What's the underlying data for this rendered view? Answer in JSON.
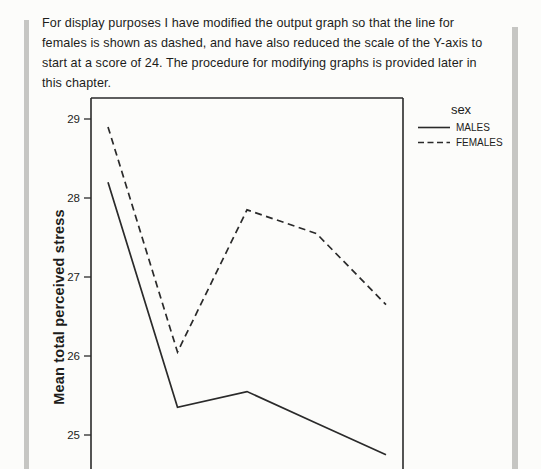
{
  "page": {
    "paragraph_lines": [
      "For display purposes I have modified the output graph so that the line for",
      "females is shown as dashed, and have also reduced the scale of the Y-axis to",
      "start at a score of 24. The procedure for modifying graphs is provided later in",
      "this chapter."
    ]
  },
  "colors": {
    "ink": "#1d1d1b",
    "chart_line": "#2a2a2a",
    "page_rule": "#c6c6c3",
    "background": "#fcfcfa"
  },
  "chart_data": {
    "type": "line",
    "title": "",
    "xlabel": "",
    "ylabel": "Mean total perceived stress",
    "x": [
      1,
      2,
      3,
      4,
      5
    ],
    "x_axis_labels_visible": false,
    "y_ticks": [
      29,
      28,
      27,
      26,
      25
    ],
    "y_axis_starts_at": 24,
    "ylim_visible": [
      24.55,
      29.25
    ],
    "grid": false,
    "legend": {
      "title": "sex",
      "position": "top-right-outside",
      "entries": [
        {
          "label": "MALES",
          "style": "solid"
        },
        {
          "label": "FEMALES",
          "style": "dashed"
        }
      ]
    },
    "series": [
      {
        "name": "MALES",
        "style": "solid",
        "values": [
          28.2,
          25.35,
          25.55,
          25.15,
          24.75
        ]
      },
      {
        "name": "FEMALES",
        "style": "dashed",
        "values": [
          28.9,
          26.05,
          27.85,
          27.55,
          26.65
        ]
      }
    ]
  }
}
